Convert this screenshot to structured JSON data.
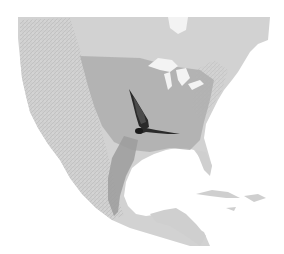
{
  "map": {
    "region": "North America",
    "style": "grayscale shaded relief",
    "colors": {
      "background": "#ffffff",
      "ocean": "#ffffff",
      "land": "#c9c9c9",
      "land_light": "#d6d6d6",
      "relief": "#b8b8b8",
      "range": "#a9a9a9",
      "range_dark": "#9a9a9a",
      "lakes": "#f2f2f2",
      "butterfly": "#2a2a2a"
    },
    "layers": [
      {
        "name": "landmass",
        "label": ""
      },
      {
        "name": "great-lakes",
        "label": ""
      },
      {
        "name": "migration-range",
        "label": ""
      },
      {
        "name": "migration-corridor",
        "label": ""
      },
      {
        "name": "butterfly",
        "label": ""
      }
    ]
  }
}
